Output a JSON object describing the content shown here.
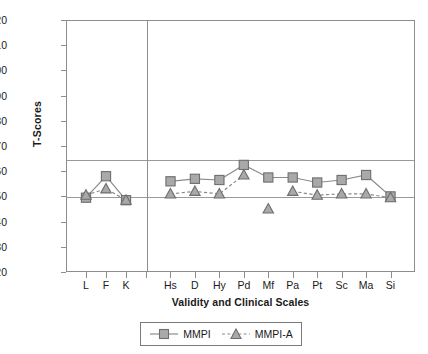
{
  "chart_data": {
    "type": "line",
    "title": "",
    "xlabel": "Validity and Clinical Scales",
    "ylabel": "T-Scores",
    "ylim": [
      20,
      120
    ],
    "yticks": [
      20,
      30,
      40,
      50,
      60,
      70,
      80,
      90,
      100,
      110,
      120
    ],
    "grid": false,
    "reference_lines": [
      65,
      50
    ],
    "legend_position": "bottom-center",
    "categories": [
      "L",
      "F",
      "K",
      "Hs",
      "D",
      "Hy",
      "Pd",
      "Mf",
      "Pa",
      "Pt",
      "Sc",
      "Ma",
      "Si"
    ],
    "validity_scales": [
      "L",
      "F",
      "K"
    ],
    "clinical_scales": [
      "Hs",
      "D",
      "Hy",
      "Pd",
      "Mf",
      "Pa",
      "Pt",
      "Sc",
      "Ma",
      "Si"
    ],
    "series": [
      {
        "name": "MMPI",
        "marker": "square",
        "line": "solid",
        "color": "#8a8a8a",
        "values": [
          49.5,
          58.0,
          48.5,
          56.0,
          57.0,
          56.5,
          62.5,
          57.5,
          57.5,
          55.5,
          56.5,
          58.5,
          50.0
        ]
      },
      {
        "name": "MMPI-A",
        "marker": "triangle",
        "line": "dashed",
        "color": "#8a8a8a",
        "values": [
          50.5,
          53.0,
          48.5,
          51.0,
          52.0,
          51.0,
          58.5,
          45.0,
          52.0,
          50.5,
          51.0,
          51.0,
          49.5
        ]
      }
    ]
  },
  "axis": {
    "y_title": "T-Scores",
    "x_title": "Validity and Clinical Scales",
    "y_ticks": [
      "120",
      "110",
      "100",
      "90",
      "80",
      "70",
      "60",
      "50",
      "40",
      "30",
      "20"
    ],
    "x_ticks": [
      "L",
      "F",
      "K",
      "Hs",
      "D",
      "Hy",
      "Pd",
      "Mf",
      "Pa",
      "Pt",
      "Sc",
      "Ma",
      "Si"
    ]
  },
  "legend": {
    "items": [
      {
        "label": "MMPI",
        "marker_icon": "square-marker-icon",
        "line_icon": "solid-line-icon"
      },
      {
        "label": "MMPI-A",
        "marker_icon": "triangle-marker-icon",
        "line_icon": "dashed-line-icon"
      }
    ]
  },
  "colors": {
    "marker_fill": "#a9a9a9",
    "marker_stroke": "#6e6e6e",
    "line": "#8a8a8a",
    "axis": "#8d8d8d",
    "gridline": "#9a9a9a",
    "text": "#1a1a1a"
  }
}
